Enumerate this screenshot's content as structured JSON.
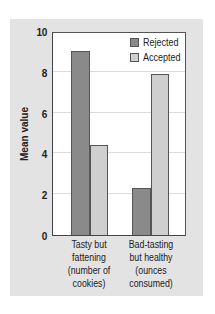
{
  "chart_data": {
    "type": "bar",
    "title": "",
    "xlabel": "",
    "ylabel": "Mean value",
    "ylim": [
      0,
      10
    ],
    "yticks": [
      0,
      2,
      4,
      6,
      8,
      10
    ],
    "grid": true,
    "legend_position": "top-right",
    "categories": [
      "Tasty but fattening (number of cookies)",
      "Bad-tasting but healthy (ounces consumed)"
    ],
    "category_lines": [
      [
        "Tasty but",
        "fattening",
        "(number of",
        "cookies)"
      ],
      [
        "Bad-tasting",
        "but healthy",
        "(ounces",
        "consumed)"
      ]
    ],
    "series": [
      {
        "name": "Rejected",
        "color": "#8a8a8a",
        "values": [
          9.0,
          2.3
        ]
      },
      {
        "name": "Accepted",
        "color": "#cfcfcf",
        "values": [
          4.4,
          7.9
        ]
      }
    ]
  },
  "colors": {
    "panel_background": "#e3e3e3",
    "plot_background": "#ffffff"
  }
}
